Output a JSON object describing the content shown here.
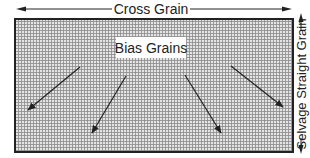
{
  "diagram": {
    "top_label": "Cross Grain",
    "right_label": "Selvage Straight Grain",
    "center_label": "Bias Grains",
    "colors": {
      "border": "#222222",
      "grid": "#8a8a8a",
      "fabric_bg": "#d8d8d8",
      "arrow": "#222222",
      "label_bg": "#ffffff"
    },
    "fabric_rect": {
      "x": 15,
      "y": 19,
      "width": 278,
      "height": 133
    },
    "bias_arrows": [
      {
        "from": [
          80,
          67
        ],
        "to": [
          28,
          110
        ]
      },
      {
        "from": [
          126,
          76
        ],
        "to": [
          92,
          133
        ]
      },
      {
        "from": [
          185,
          75
        ],
        "to": [
          221,
          133
        ]
      },
      {
        "from": [
          231,
          66
        ],
        "to": [
          283,
          107
        ]
      }
    ]
  }
}
